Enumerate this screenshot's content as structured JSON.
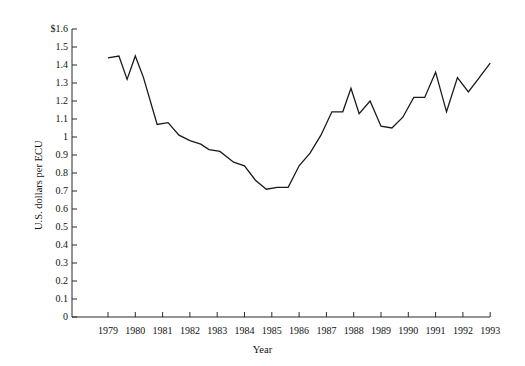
{
  "chart_data": {
    "type": "line",
    "title": "",
    "subtitle": "",
    "xlabel": "Year",
    "ylabel": "U.S. dollars per ECU",
    "xlim": [
      1978.5,
      1993.0
    ],
    "ylim": [
      0,
      1.6
    ],
    "grid": false,
    "legend": null,
    "x_tick_labels": [
      "1979",
      "1980",
      "1981",
      "1982",
      "1983",
      "1984",
      "1985",
      "1986",
      "1987",
      "1988",
      "1989",
      "1990",
      "1991",
      "1992",
      "1993"
    ],
    "x_ticks": [
      1979,
      1980,
      1981,
      1982,
      1983,
      1984,
      1985,
      1986,
      1987,
      1988,
      1989,
      1990,
      1991,
      1992,
      1993
    ],
    "y_tick_labels": [
      "0",
      "0.1",
      "0.2",
      "0.3",
      "0.4",
      "0.5",
      "0.6",
      "0.7",
      "0.8",
      "0.9",
      "1",
      "1.1",
      "1.2",
      "1.3",
      "1.4",
      "1.5",
      "$1.6"
    ],
    "y_ticks": [
      0,
      0.1,
      0.2,
      0.3,
      0.4,
      0.5,
      0.6,
      0.7,
      0.8,
      0.9,
      1.0,
      1.1,
      1.2,
      1.3,
      1.4,
      1.5,
      1.6
    ],
    "series": [
      {
        "name": "U.S. dollars per ECU",
        "color": "#1a1a1a",
        "x": [
          1979.0,
          1979.4,
          1979.7,
          1980.0,
          1980.3,
          1980.8,
          1981.2,
          1981.6,
          1982.0,
          1982.4,
          1982.7,
          1983.1,
          1983.6,
          1984.0,
          1984.4,
          1984.8,
          1985.2,
          1985.6,
          1986.0,
          1986.4,
          1986.8,
          1987.2,
          1987.6,
          1987.9,
          1988.2,
          1988.6,
          1989.0,
          1989.4,
          1989.8,
          1990.2,
          1990.6,
          1991.0,
          1991.4,
          1991.8,
          1992.2,
          1992.6,
          1993.0
        ],
        "values": [
          1.44,
          1.45,
          1.32,
          1.45,
          1.33,
          1.07,
          1.08,
          1.01,
          0.98,
          0.96,
          0.93,
          0.92,
          0.86,
          0.84,
          0.76,
          0.71,
          0.72,
          0.72,
          0.84,
          0.91,
          1.01,
          1.14,
          1.14,
          1.27,
          1.13,
          1.2,
          1.06,
          1.05,
          1.11,
          1.22,
          1.22,
          1.36,
          1.14,
          1.33,
          1.25,
          1.33,
          1.41
        ]
      }
    ]
  },
  "axes_geometry": {
    "plot_left_px": 72,
    "plot_right_px": 490,
    "plot_top_px": 29,
    "plot_bottom_px": 317,
    "x_origin_value": 1979,
    "x_origin_px": 108,
    "px_per_year": 27.3,
    "y_zero_px": 317,
    "px_per_tenth": 18
  }
}
